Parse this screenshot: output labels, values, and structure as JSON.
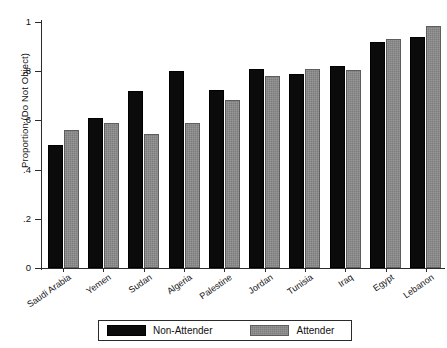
{
  "chart_data": {
    "type": "bar",
    "title": "",
    "xlabel": "",
    "ylabel": "Proportion (Do Not Object)",
    "ylim": [
      0,
      1
    ],
    "yticks": [
      "0",
      ".2",
      ".4",
      ".6",
      ".8",
      "1"
    ],
    "ytick_values": [
      0,
      0.2,
      0.4,
      0.6,
      0.8,
      1
    ],
    "grid": false,
    "legend_position": "bottom-center",
    "categories": [
      "Saudi Arabia",
      "Yemen",
      "Sudan",
      "Algeria",
      "Palestine",
      "Jordan",
      "Tunisia",
      "Iraq",
      "Egypt",
      "Lebanon"
    ],
    "series": [
      {
        "name": "Non-Attender",
        "color": "#0b0b0b",
        "values": [
          0.5,
          0.61,
          0.72,
          0.8,
          0.725,
          0.81,
          0.79,
          0.82,
          0.92,
          0.94
        ]
      },
      {
        "name": "Attender",
        "color": "#7d7d7d",
        "values": [
          0.56,
          0.59,
          0.545,
          0.59,
          0.685,
          0.78,
          0.81,
          0.805,
          0.93,
          0.985
        ]
      }
    ]
  },
  "legend": {
    "items": [
      {
        "label": "Non-Attender",
        "swatch": "black"
      },
      {
        "label": "Attender",
        "swatch": "grey"
      }
    ]
  }
}
